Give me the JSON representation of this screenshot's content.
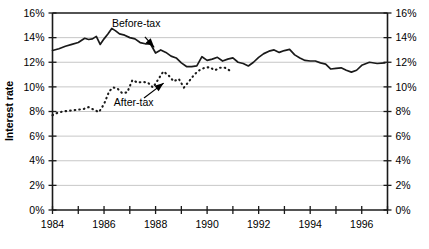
{
  "chart_data": {
    "type": "line",
    "title": "",
    "xlabel": "",
    "ylabel": "Interest rate",
    "xlim": [
      1984,
      1997
    ],
    "ylim": [
      0,
      16
    ],
    "grid": true,
    "legend_position": "inline-annotations",
    "y_tick_labels": [
      "0%",
      "2%",
      "4%",
      "6%",
      "8%",
      "10%",
      "12%",
      "14%",
      "16%"
    ],
    "y_tick_values": [
      0,
      2,
      4,
      6,
      8,
      10,
      12,
      14,
      16
    ],
    "y_axis_both_sides": true,
    "x_tick_values": [
      1984,
      1985,
      1986,
      1987,
      1988,
      1989,
      1990,
      1991,
      1992,
      1993,
      1994,
      1995,
      1996,
      1997
    ],
    "x_tick_labels": [
      "1984",
      "",
      "1986",
      "",
      "1988",
      "",
      "1990",
      "",
      "1992",
      "",
      "1994",
      "",
      "1996",
      ""
    ],
    "x_labeled_years": [
      "1984",
      "1986",
      "1988",
      "1990",
      "1992",
      "1994",
      "1996"
    ],
    "series": [
      {
        "name": "Before-tax",
        "style": "solid",
        "color": "#1a1a1a",
        "x": [
          1984.0,
          1984.25,
          1984.5,
          1984.75,
          1985.0,
          1985.25,
          1985.4,
          1985.55,
          1985.7,
          1985.85,
          1986.0,
          1986.15,
          1986.3,
          1986.45,
          1986.6,
          1986.8,
          1987.0,
          1987.2,
          1987.4,
          1987.6,
          1987.8,
          1988.0,
          1988.2,
          1988.4,
          1988.6,
          1988.8,
          1989.0,
          1989.2,
          1989.4,
          1989.6,
          1989.8,
          1990.0,
          1990.2,
          1990.4,
          1990.6,
          1990.8,
          1991.0,
          1991.2,
          1991.4,
          1991.6,
          1991.8,
          1992.0,
          1992.2,
          1992.4,
          1992.6,
          1992.8,
          1993.0,
          1993.2,
          1993.4,
          1993.6,
          1993.8,
          1994.0,
          1994.2,
          1994.4,
          1994.6,
          1994.8,
          1995.0,
          1995.2,
          1995.4,
          1995.6,
          1995.8,
          1996.0,
          1996.3,
          1996.6,
          1996.9
        ],
        "y": [
          12.95,
          13.1,
          13.3,
          13.45,
          13.6,
          13.95,
          13.85,
          13.9,
          14.1,
          13.45,
          13.9,
          14.3,
          14.75,
          14.55,
          14.3,
          14.2,
          14.0,
          13.9,
          13.6,
          13.5,
          13.5,
          12.75,
          13.0,
          12.8,
          12.5,
          12.35,
          11.95,
          11.65,
          11.65,
          11.7,
          12.45,
          12.15,
          12.25,
          12.4,
          12.1,
          12.25,
          12.35,
          12.0,
          11.9,
          11.7,
          12.0,
          12.4,
          12.7,
          12.9,
          13.0,
          12.8,
          12.95,
          13.05,
          12.6,
          12.35,
          12.15,
          12.1,
          12.1,
          11.95,
          11.85,
          11.45,
          11.5,
          11.55,
          11.35,
          11.2,
          11.35,
          11.75,
          12.0,
          11.9,
          11.95
        ]
      },
      {
        "name": "After-tax",
        "style": "dotted",
        "color": "#1a1a1a",
        "x": [
          1984.0,
          1984.2,
          1984.4,
          1984.6,
          1984.8,
          1985.0,
          1985.2,
          1985.4,
          1985.6,
          1985.8,
          1986.0,
          1986.2,
          1986.35,
          1986.5,
          1986.7,
          1986.9,
          1987.1,
          1987.3,
          1987.5,
          1987.7,
          1987.9,
          1988.1,
          1988.3,
          1988.5,
          1988.7,
          1988.9,
          1989.1,
          1989.3,
          1989.5,
          1989.7,
          1989.9,
          1990.1,
          1990.3,
          1990.5,
          1990.7,
          1990.9
        ],
        "y": [
          7.7,
          7.9,
          8.0,
          8.05,
          8.1,
          8.15,
          8.2,
          8.35,
          8.15,
          7.95,
          8.6,
          9.65,
          9.95,
          9.9,
          9.5,
          9.55,
          10.55,
          10.35,
          10.4,
          10.35,
          9.95,
          10.6,
          11.25,
          10.95,
          10.45,
          10.65,
          9.95,
          10.45,
          11.0,
          11.35,
          11.55,
          11.6,
          11.35,
          11.55,
          11.55,
          11.3
        ]
      }
    ],
    "annotations": [
      {
        "text": "Before-tax",
        "x": 1987.25,
        "y": 14.85,
        "arrow_to_x": 1988.1,
        "arrow_to_y": 12.85
      },
      {
        "text": "After-tax",
        "x": 1987.15,
        "y": 8.45,
        "arrow_to_x": 1988.5,
        "arrow_to_y": 10.6
      }
    ]
  }
}
